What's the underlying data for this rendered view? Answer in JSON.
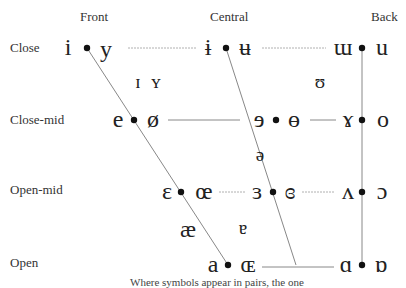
{
  "columns": [
    {
      "label": "Front",
      "x": 80,
      "y": 10
    },
    {
      "label": "Central",
      "x": 210,
      "y": 10
    },
    {
      "label": "Back",
      "x": 371,
      "y": 10
    }
  ],
  "rows": [
    {
      "label": "Close",
      "x": 10,
      "y": 41
    },
    {
      "label": "Close-mid",
      "x": 10,
      "y": 113
    },
    {
      "label": "Open-mid",
      "x": 10,
      "y": 183
    },
    {
      "label": "Open",
      "x": 10,
      "y": 256
    }
  ],
  "vowels": [
    {
      "symbol": "i",
      "x": 68,
      "y": 48,
      "row": "Close",
      "column": "Front",
      "rounded": false
    },
    {
      "symbol": "y",
      "x": 106,
      "y": 50,
      "row": "Close",
      "column": "Front",
      "rounded": true
    },
    {
      "symbol": "ɨ",
      "x": 208,
      "y": 48,
      "row": "Close",
      "column": "Central",
      "rounded": false
    },
    {
      "symbol": "ʉ",
      "x": 245,
      "y": 48,
      "row": "Close",
      "column": "Central",
      "rounded": true
    },
    {
      "symbol": "ɯ",
      "x": 343,
      "y": 48,
      "row": "Close",
      "column": "Back",
      "rounded": false
    },
    {
      "symbol": "u",
      "x": 382,
      "y": 48,
      "row": "Close",
      "column": "Back",
      "rounded": true
    },
    {
      "symbol": "ɪ",
      "x": 138,
      "y": 82,
      "row": "Near-close",
      "column": "Near-front",
      "rounded": false,
      "mid": true
    },
    {
      "symbol": "ʏ",
      "x": 156,
      "y": 82,
      "row": "Near-close",
      "column": "Near-front",
      "rounded": true,
      "mid": true
    },
    {
      "symbol": "ʊ",
      "x": 320,
      "y": 82,
      "row": "Near-close",
      "column": "Near-back",
      "rounded": true,
      "mid": true
    },
    {
      "symbol": "e",
      "x": 118,
      "y": 120,
      "row": "Close-mid",
      "column": "Front",
      "rounded": false
    },
    {
      "symbol": "ø",
      "x": 153,
      "y": 120,
      "row": "Close-mid",
      "column": "Front",
      "rounded": true
    },
    {
      "symbol": "ɘ",
      "x": 259,
      "y": 120,
      "row": "Close-mid",
      "column": "Central",
      "rounded": false
    },
    {
      "symbol": "ɵ",
      "x": 294,
      "y": 120,
      "row": "Close-mid",
      "column": "Central",
      "rounded": true
    },
    {
      "symbol": "ɤ",
      "x": 348,
      "y": 120,
      "row": "Close-mid",
      "column": "Back",
      "rounded": false
    },
    {
      "symbol": "o",
      "x": 383,
      "y": 120,
      "row": "Close-mid",
      "column": "Back",
      "rounded": true
    },
    {
      "symbol": "ə",
      "x": 260,
      "y": 155,
      "row": "Mid",
      "column": "Central",
      "rounded": false,
      "mid": true
    },
    {
      "symbol": "ɛ",
      "x": 167,
      "y": 192,
      "row": "Open-mid",
      "column": "Front",
      "rounded": false
    },
    {
      "symbol": "œ",
      "x": 204,
      "y": 192,
      "row": "Open-mid",
      "column": "Front",
      "rounded": true
    },
    {
      "symbol": "ɜ",
      "x": 257,
      "y": 192,
      "row": "Open-mid",
      "column": "Central",
      "rounded": false
    },
    {
      "symbol": "ɞ",
      "x": 290,
      "y": 192,
      "row": "Open-mid",
      "column": "Central",
      "rounded": true
    },
    {
      "symbol": "ʌ",
      "x": 348,
      "y": 192,
      "row": "Open-mid",
      "column": "Back",
      "rounded": false
    },
    {
      "symbol": "ɔ",
      "x": 382,
      "y": 192,
      "row": "Open-mid",
      "column": "Back",
      "rounded": true
    },
    {
      "symbol": "æ",
      "x": 188,
      "y": 230,
      "row": "Near-open",
      "column": "Front",
      "rounded": false
    },
    {
      "symbol": "ɐ",
      "x": 243,
      "y": 228,
      "row": "Near-open",
      "column": "Central",
      "rounded": false,
      "mid": true
    },
    {
      "symbol": "a",
      "x": 213,
      "y": 265,
      "row": "Open",
      "column": "Front",
      "rounded": false
    },
    {
      "symbol": "ɶ",
      "x": 248,
      "y": 265,
      "row": "Open",
      "column": "Front",
      "rounded": true
    },
    {
      "symbol": "ɑ",
      "x": 346,
      "y": 265,
      "row": "Open",
      "column": "Back",
      "rounded": false
    },
    {
      "symbol": "ɒ",
      "x": 381,
      "y": 265,
      "row": "Open",
      "column": "Back",
      "rounded": true
    }
  ],
  "dots": [
    {
      "x": 87,
      "y": 48
    },
    {
      "x": 226,
      "y": 48
    },
    {
      "x": 362,
      "y": 48
    },
    {
      "x": 134,
      "y": 120
    },
    {
      "x": 276,
      "y": 120
    },
    {
      "x": 362,
      "y": 120
    },
    {
      "x": 181,
      "y": 192
    },
    {
      "x": 273,
      "y": 192
    },
    {
      "x": 362,
      "y": 192
    },
    {
      "x": 228,
      "y": 265
    },
    {
      "x": 362,
      "y": 265
    }
  ],
  "lines": {
    "front": {
      "x1": 87,
      "y1": 48,
      "x2": 228,
      "y2": 265
    },
    "central": {
      "x1": 226,
      "y1": 48,
      "x2": 296,
      "y2": 265
    },
    "back": {
      "x1": 362,
      "y1": 48,
      "x2": 362,
      "y2": 265
    },
    "horizontal": [
      {
        "x1": 128,
        "y1": 48,
        "x2": 196,
        "y2": 48,
        "dashed": true
      },
      {
        "x1": 262,
        "y1": 48,
        "x2": 326,
        "y2": 48,
        "dashed": true
      },
      {
        "x1": 168,
        "y1": 120,
        "x2": 240,
        "y2": 120,
        "dashed": false
      },
      {
        "x1": 310,
        "y1": 120,
        "x2": 336,
        "y2": 120,
        "dashed": false
      },
      {
        "x1": 219,
        "y1": 192,
        "x2": 246,
        "y2": 192,
        "dashed": true
      },
      {
        "x1": 302,
        "y1": 192,
        "x2": 334,
        "y2": 192,
        "dashed": true
      },
      {
        "x1": 262,
        "y1": 267,
        "x2": 334,
        "y2": 267,
        "dashed": false
      }
    ]
  },
  "footer": {
    "text": "Where symbols appear in pairs, the one"
  },
  "colors": {
    "line": "#888888",
    "dashed": "#b0b0b0",
    "dot": "#111111",
    "text": "#222222"
  }
}
